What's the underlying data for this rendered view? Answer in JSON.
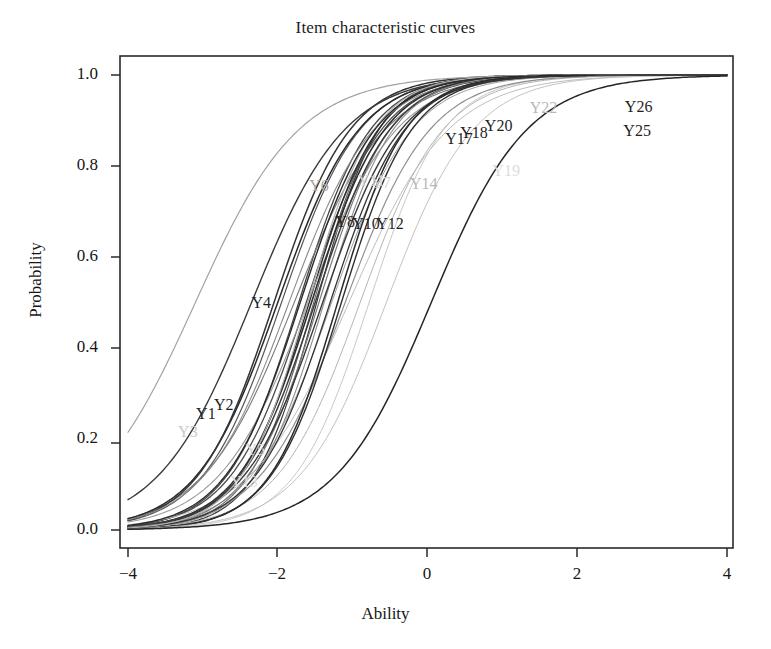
{
  "chart": {
    "title": "Item characteristic curves",
    "xlabel": "Ability",
    "ylabel": "Probability"
  },
  "chart_data": {
    "type": "line",
    "title": "Item characteristic curves",
    "xlabel": "Ability",
    "ylabel": "Probability",
    "xlim": [
      -4,
      4
    ],
    "ylim": [
      0,
      1
    ],
    "xticks": [
      -4,
      -2,
      0,
      2,
      4
    ],
    "xticklabels": [
      "−4",
      "−2",
      "0",
      "2",
      "4"
    ],
    "yticks": [
      0.0,
      0.2,
      0.4,
      0.6,
      0.8,
      1.0
    ],
    "yticklabels": [
      "0.0",
      "0.2",
      "0.4",
      "0.6",
      "0.8",
      "1.0"
    ],
    "grid": false,
    "legend": "none (curves labelled in-place)",
    "model": "2PL logistic: P(x) = 1 / (1 + exp(-a*(x-b)))",
    "series": [
      {
        "name": "Y1",
        "a": 0.92,
        "b": -2.0,
        "color": "#2b2b2b",
        "width": 1.5,
        "label_x": -2.96,
        "label_y": 0.254,
        "label_color": "#1f1f1f"
      },
      {
        "name": "Y2",
        "a": 0.98,
        "b": -2.05,
        "color": "#333333",
        "width": 1.5,
        "label_x": -2.72,
        "label_y": 0.274,
        "label_color": "#1f1f1f"
      },
      {
        "name": "Y3",
        "a": 0.88,
        "b": -1.85,
        "color": "#8a8a8a",
        "width": 1.1,
        "label_x": -3.2,
        "label_y": 0.215,
        "label_color": "#c9c9c9"
      },
      {
        "name": "Y4",
        "a": 0.8,
        "b": -2.35,
        "color": "#3a3a3a",
        "width": 1.4,
        "label_x": -2.22,
        "label_y": 0.5,
        "label_color": "#1f1f1f"
      },
      {
        "name": "Y5",
        "a": 0.84,
        "b": -1.6,
        "color": "#9a9a9a",
        "width": 1.1,
        "label_x": -2.3,
        "label_y": 0.175,
        "label_color": "#d6d6d6"
      },
      {
        "name": "Y6",
        "a": 0.72,
        "b": -3.1,
        "color": "#a2a2a2",
        "width": 1.2,
        "label_x": -1.45,
        "label_y": 0.755,
        "label_color": "#a8a8a8"
      },
      {
        "name": "Y7",
        "a": 1.05,
        "b": -1.45,
        "color": "#7a7a7a",
        "width": 1.2,
        "label_x": -0.62,
        "label_y": 0.762,
        "label_color": "#cfcfcf"
      },
      {
        "name": "Y8",
        "a": 1.02,
        "b": -1.55,
        "color": "#2e2e2e",
        "width": 1.6,
        "label_x": -1.1,
        "label_y": 0.678,
        "label_color": "#1f1f1f"
      },
      {
        "name": "Y10",
        "a": 1.0,
        "b": -1.5,
        "color": "#3d3d3d",
        "width": 1.5,
        "label_x": -0.82,
        "label_y": 0.672,
        "label_color": "#1f1f1f"
      },
      {
        "name": "Y11",
        "a": 1.08,
        "b": -1.38,
        "color": "#8e8e8e",
        "width": 1.1,
        "label_x": -0.75,
        "label_y": 0.768,
        "label_color": "#d2d2d2"
      },
      {
        "name": "Y12",
        "a": 0.95,
        "b": -1.4,
        "color": "#3a3a3a",
        "width": 1.4,
        "label_x": -0.5,
        "label_y": 0.672,
        "label_color": "#1f1f1f"
      },
      {
        "name": "Y13",
        "a": 0.9,
        "b": -0.9,
        "color": "#b4b4b4",
        "width": 1.0,
        "label_x": -2.45,
        "label_y": 0.105,
        "label_color": "#e0e0e0"
      },
      {
        "name": "Y14",
        "a": 0.88,
        "b": -1.1,
        "color": "#8f8f8f",
        "width": 1.2,
        "label_x": -0.05,
        "label_y": 0.76,
        "label_color": "#b8b8b8"
      },
      {
        "name": "Y17",
        "a": 1.1,
        "b": -1.2,
        "color": "#2a2a2a",
        "width": 1.5,
        "label_x": 0.42,
        "label_y": 0.86,
        "label_color": "#1f1f1f"
      },
      {
        "name": "Y18",
        "a": 1.06,
        "b": -1.15,
        "color": "#303030",
        "width": 1.4,
        "label_x": 0.62,
        "label_y": 0.872,
        "label_color": "#1f1f1f"
      },
      {
        "name": "Y19",
        "a": 0.86,
        "b": -0.55,
        "color": "#c2c2c2",
        "width": 1.0,
        "label_x": 1.05,
        "label_y": 0.79,
        "label_color": "#dcdcdc"
      },
      {
        "name": "Y20",
        "a": 1.0,
        "b": -1.3,
        "color": "#333333",
        "width": 1.3,
        "label_x": 0.95,
        "label_y": 0.888,
        "label_color": "#1f1f1f"
      },
      {
        "name": "Y22",
        "a": 1.12,
        "b": -1.6,
        "color": "#b0b0b0",
        "width": 1.2,
        "label_x": 1.55,
        "label_y": 0.928,
        "label_color": "#b9b9b9"
      },
      {
        "name": "Y25",
        "a": 0.78,
        "b": 0.05,
        "color": "#262626",
        "width": 1.5,
        "label_x": 2.8,
        "label_y": 0.878,
        "label_color": "#1f1f1f"
      },
      {
        "name": "Y26",
        "a": 1.0,
        "b": -1.7,
        "color": "#2b2b2b",
        "width": 1.4,
        "label_x": 2.82,
        "label_y": 0.93,
        "label_color": "#1f1f1f"
      }
    ],
    "extra_unlabeled_curves": [
      {
        "a": 0.95,
        "b": -1.95,
        "color": "#555555",
        "width": 1.2
      },
      {
        "a": 1.04,
        "b": -1.72,
        "color": "#444444",
        "width": 1.3
      },
      {
        "a": 1.15,
        "b": -1.52,
        "color": "#606060",
        "width": 1.1
      },
      {
        "a": 0.93,
        "b": -1.28,
        "color": "#9c9c9c",
        "width": 1.0
      },
      {
        "a": 1.2,
        "b": -1.48,
        "color": "#3a3a3a",
        "width": 1.2
      },
      {
        "a": 0.82,
        "b": -1.78,
        "color": "#777777",
        "width": 1.1
      },
      {
        "a": 0.99,
        "b": -1.62,
        "color": "#4c4c4c",
        "width": 1.3
      },
      {
        "a": 1.08,
        "b": -1.58,
        "color": "#2f2f2f",
        "width": 1.4
      },
      {
        "a": 0.75,
        "b": -1.05,
        "color": "#bdbdbd",
        "width": 1.0
      },
      {
        "a": 1.0,
        "b": -0.78,
        "color": "#c8c8c8",
        "width": 1.0
      }
    ]
  },
  "geometry": {
    "plot_left": 120,
    "plot_right": 733,
    "plot_top": 56,
    "plot_bottom": 548,
    "x_axis_pixel_ticks": [
      128,
      277,
      427,
      577,
      727
    ],
    "y_axis_pixel_ticks": [
      75,
      166,
      257,
      348,
      443,
      530
    ],
    "frame_color": "#2a2a2a"
  }
}
